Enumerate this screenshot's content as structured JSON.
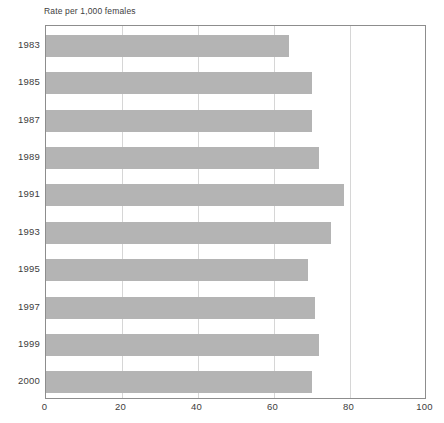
{
  "chart_data": {
    "type": "bar",
    "orientation": "horizontal",
    "title": "",
    "subtitle": "",
    "axis_note": "Rate per 1,000 females",
    "xlabel": "",
    "ylabel": "",
    "categories": [
      "1983",
      "1985",
      "1987",
      "1989",
      "1991",
      "1993",
      "1995",
      "1997",
      "1999",
      "2000"
    ],
    "values": [
      64,
      70,
      70,
      72,
      78.5,
      75,
      69,
      71,
      72,
      70
    ],
    "series": [
      {
        "name": "Rate per 1,000 females",
        "values": [
          64,
          70,
          70,
          72,
          78.5,
          75,
          69,
          71,
          72,
          70
        ]
      }
    ],
    "xlim": [
      0,
      100
    ],
    "xticks": [
      0,
      20,
      40,
      60,
      80,
      100
    ],
    "xticklabels": [
      "0",
      "20",
      "40",
      "60",
      "80",
      "100"
    ],
    "yticklabels": [
      "1983",
      "1985",
      "1987",
      "1989",
      "1991",
      "1993",
      "1995",
      "1997",
      "1999",
      "2000"
    ],
    "grid": "vertical-only",
    "legend": "none",
    "bar_color": "#b4b4b4",
    "gridline_color": "#d6d6d6",
    "frame_color": "#8d8d8d",
    "text_color": "#3d3d3d"
  }
}
